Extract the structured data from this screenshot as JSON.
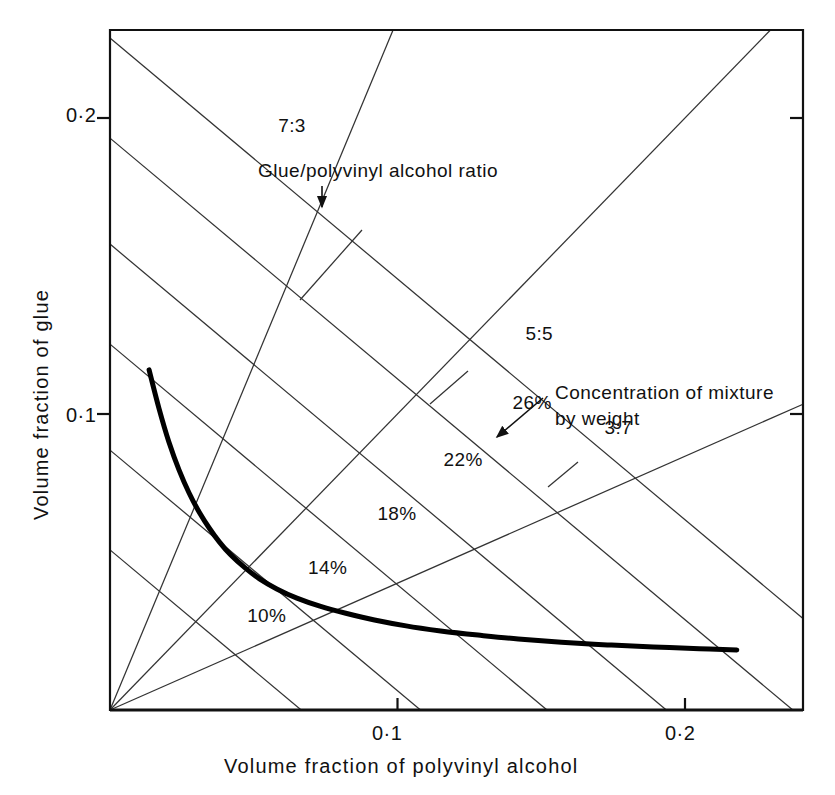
{
  "chart_data": {
    "type": "line",
    "title": "",
    "xlabel": "Volume fraction of polyvinyl alcohol",
    "ylabel": "Volume fraction of glue",
    "xlim": [
      0,
      0.2415
    ],
    "ylim": [
      0,
      0.2297
    ],
    "grid": false,
    "xticks": [
      0.1,
      0.2
    ],
    "xtick_labels": [
      "0·1",
      "0·2"
    ],
    "yticks": [
      0.1,
      0.2
    ],
    "ytick_labels": [
      "0·1",
      "0·2"
    ],
    "annotations": {
      "ratio_caption": "Glue/polyvinyl alcohol ratio",
      "concentration_caption_line1": "Concentration of mixture",
      "concentration_caption_line2": "by weight"
    },
    "ratio_lines": [
      {
        "label": "7:3",
        "slope": 2.3333,
        "label_x": 0.0585,
        "label_y": 0.1965
      },
      {
        "label": "5:5",
        "slope": 1.0,
        "label_x": 0.1445,
        "label_y": 0.1262
      },
      {
        "label": "3:7",
        "slope": 0.4286,
        "label_x": 0.172,
        "label_y": 0.0946
      }
    ],
    "concentration_lines": [
      {
        "label": "10%",
        "y_intercept": 0.0541,
        "x_intercept": 0.0665,
        "label_x": 0.0477,
        "label_y": 0.0312
      },
      {
        "label": "14%",
        "y_intercept": 0.0878,
        "x_intercept": 0.108,
        "label_x": 0.0689,
        "label_y": 0.0474
      },
      {
        "label": "18%",
        "y_intercept": 0.1236,
        "x_intercept": 0.152,
        "label_x": 0.093,
        "label_y": 0.0655
      },
      {
        "label": "22%",
        "y_intercept": 0.1574,
        "x_intercept": 0.1935,
        "label_x": 0.116,
        "label_y": 0.0837
      },
      {
        "label": "26%",
        "y_intercept": 0.1932,
        "x_intercept": 0.2375,
        "label_x": 0.14,
        "label_y": 0.103
      },
      {
        "label": "",
        "y_intercept": 0.227,
        "x_intercept": 0.279,
        "label_x": null,
        "label_y": null
      }
    ],
    "series": [
      {
        "name": "minimum viscosity boundary",
        "points": [
          [
            0.0136,
            0.1149
          ],
          [
            0.017,
            0.102
          ],
          [
            0.0205,
            0.0905
          ],
          [
            0.024,
            0.0811
          ],
          [
            0.0275,
            0.0733
          ],
          [
            0.031,
            0.0669
          ],
          [
            0.0345,
            0.0615
          ],
          [
            0.038,
            0.0568
          ],
          [
            0.042,
            0.0524
          ],
          [
            0.047,
            0.048
          ],
          [
            0.052,
            0.0443
          ],
          [
            0.058,
            0.0409
          ],
          [
            0.065,
            0.0378
          ],
          [
            0.073,
            0.0351
          ],
          [
            0.082,
            0.0327
          ],
          [
            0.092,
            0.0304
          ],
          [
            0.103,
            0.0284
          ],
          [
            0.115,
            0.0267
          ],
          [
            0.128,
            0.0253
          ],
          [
            0.142,
            0.024
          ],
          [
            0.157,
            0.0229
          ],
          [
            0.173,
            0.022
          ],
          [
            0.189,
            0.0213
          ],
          [
            0.205,
            0.0207
          ],
          [
            0.218,
            0.0203
          ]
        ]
      }
    ]
  }
}
